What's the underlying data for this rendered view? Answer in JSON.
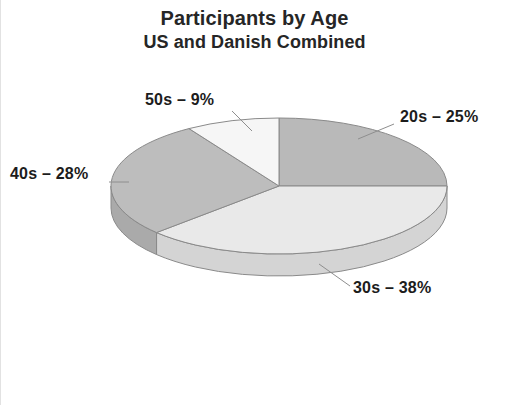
{
  "chart": {
    "title": "Participants by Age",
    "subtitle": "US and Danish Combined"
  },
  "labels": {
    "s20": "20s – 25%",
    "s30": "30s – 38%",
    "s40": "40s – 28%",
    "s50": "50s – 9%"
  },
  "chart_data": {
    "type": "pie",
    "title": "Participants by Age",
    "subtitle": "US and Danish Combined",
    "categories": [
      "20s",
      "30s",
      "40s",
      "50s"
    ],
    "values": [
      25,
      38,
      28,
      9
    ],
    "value_unit": "%",
    "labels": [
      "20s – 25%",
      "30s – 38%",
      "40s – 28%",
      "50s – 9%"
    ],
    "colors": [
      "#b9b9b9",
      "#e9e9e9",
      "#bdbdbd",
      "#f6f6f6"
    ],
    "side_colors": [
      "#a6a6a6",
      "#d4d4d4",
      "#aaaaaa",
      "#e0e0e0"
    ],
    "start_angle_deg": 0,
    "direction": "clockwise",
    "three_d": true,
    "depth_px": 22,
    "legend": "none",
    "grid": false,
    "label_placement": "outside-with-leader-lines",
    "total": 100
  },
  "geometry": {
    "cx": 278,
    "cy": 186,
    "rx": 168,
    "ry": 68,
    "depth": 22,
    "outline": "#8a8a8a"
  }
}
